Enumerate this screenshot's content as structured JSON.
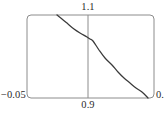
{
  "figure": {
    "width": 164,
    "height": 117,
    "background": "#ffffff"
  },
  "labels": {
    "top": "1.1",
    "bottom": "0.9",
    "left": "−0.05",
    "right": "0."
  },
  "colors": {
    "frame": "#8c8c8c",
    "curve": "#3a3a3a",
    "vertical_line": "#8c8c8c",
    "text": "#2b2b2b"
  },
  "chart_data": {
    "type": "line",
    "title": "",
    "xlabel": "",
    "ylabel": "",
    "grid": false,
    "legend": null,
    "frame": {
      "left_px": 27,
      "right_px": 154,
      "top_px": 15,
      "bottom_px": 98,
      "rounded": true
    },
    "xlim": [
      0.9,
      1.1
    ],
    "ylim": [
      -0.05,
      0.0
    ],
    "xticks": [
      0.9,
      1.1
    ],
    "xticklabels": [
      "0.9",
      "1.1"
    ],
    "yticks": [
      -0.05,
      0.0
    ],
    "yticklabels": [
      "−0.05",
      "0."
    ],
    "annotations": [
      {
        "name": "vertical-reference-line",
        "type": "vline",
        "x": 1.0,
        "x_px": 88,
        "color": "#8c8c8c"
      }
    ],
    "series": [
      {
        "name": "curve",
        "color": "#3a3a3a",
        "x": [
          0.9472,
          0.955,
          0.965,
          0.975,
          0.985,
          0.995,
          1.0,
          1.005,
          1.015,
          1.025,
          1.035,
          1.045,
          1.055,
          1.065,
          1.075,
          1.085,
          1.0945
        ],
        "y": [
          0.0,
          -0.0024,
          -0.0053,
          -0.0081,
          -0.0108,
          -0.0133,
          -0.0145,
          -0.0157,
          -0.0212,
          -0.0261,
          -0.0305,
          -0.0344,
          -0.0379,
          -0.041,
          -0.0437,
          -0.0461,
          -0.05
        ],
        "x_px": [
          57,
          62,
          68,
          74,
          80,
          87,
          90,
          93,
          99,
          105,
          112,
          118,
          124,
          130,
          136,
          142,
          148
        ],
        "y_px": [
          15,
          19,
          24,
          29,
          33,
          37,
          39,
          41,
          50,
          58,
          65,
          72,
          78,
          83,
          88,
          92,
          98
        ]
      }
    ]
  }
}
